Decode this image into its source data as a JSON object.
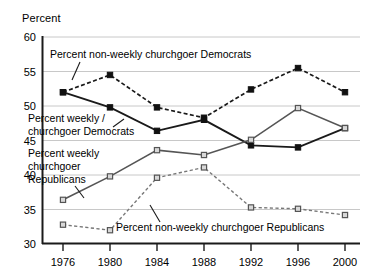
{
  "chart_data": {
    "type": "line",
    "title": "",
    "xlabel": "",
    "ylabel": "Percent",
    "ylim": [
      30,
      60
    ],
    "ytick_step": 5,
    "yticks": [
      30,
      35,
      40,
      45,
      50,
      55,
      60
    ],
    "grid": true,
    "legend_position": "inline-annotations",
    "categories": [
      1976,
      1980,
      1984,
      1988,
      1992,
      1996,
      2000
    ],
    "xtick_labels": [
      "1976",
      "1980",
      "1984",
      "1988",
      "1992",
      "1996",
      "2000"
    ],
    "series": [
      {
        "name": "Percent non-weekly churchgoer Democrats",
        "style": "dashed",
        "marker": "filled-square",
        "color": "#1a1a1a",
        "values": [
          52.0,
          54.5,
          49.8,
          48.3,
          52.4,
          55.5,
          52.0
        ]
      },
      {
        "name": "Percent weekly churchgoer Democrats",
        "style": "solid",
        "marker": "filled-square",
        "color": "#1a1a1a",
        "values": [
          52.0,
          49.8,
          46.4,
          48.0,
          44.3,
          44.0,
          46.8
        ]
      },
      {
        "name": "Percent weekly churchgoer Republicans",
        "style": "solid",
        "marker": "open-square",
        "color": "#555555",
        "values": [
          36.4,
          39.8,
          43.6,
          42.9,
          45.1,
          49.7,
          46.8
        ]
      },
      {
        "name": "Percent non-weekly churchgoer Republicans",
        "style": "dashed",
        "marker": "open-square",
        "color": "#777777",
        "values": [
          32.8,
          32.0,
          39.6,
          41.1,
          35.3,
          35.1,
          34.2
        ]
      }
    ],
    "annotations": [
      {
        "id": "annot-nonweekly-dem",
        "text": "Percent non-weekly churchgoer Democrats",
        "x": 50,
        "y": 56,
        "leader": "M 78,62 L 72,76"
      },
      {
        "id": "annot-weekly-dem-line1",
        "text": "Percent weekly /",
        "x": 28,
        "y": 120
      },
      {
        "id": "annot-weekly-dem-line2",
        "text": "churchgoer Democrats",
        "x": 28,
        "y": 133
      },
      {
        "id": "annot-weekly-rep-line1",
        "text": "Percent weekly",
        "x": 28,
        "y": 155
      },
      {
        "id": "annot-weekly-rep-line2",
        "text": "churchgoer",
        "x": 28,
        "y": 168
      },
      {
        "id": "annot-weekly-rep-line3",
        "text": "Republicans",
        "x": 28,
        "y": 181
      },
      {
        "id": "annot-nonweekly-rep",
        "text": "Percent non-weekly churchgoer Republicans",
        "x": 115,
        "y": 228
      }
    ]
  },
  "axis": {
    "y_title": "Percent"
  }
}
